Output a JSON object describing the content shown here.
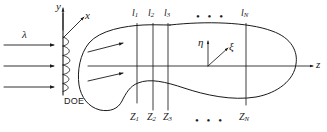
{
  "figure": {
    "stroke_color": "#1a1a1a",
    "background": "#ffffff"
  },
  "source_side": {
    "wavelength_label": "λ",
    "incident_rays_count": 3,
    "element_label": "DOE",
    "axes": {
      "vertical_label": "y",
      "oblique_label": "x"
    }
  },
  "output_side": {
    "axes": {
      "optical_axis_label": "z",
      "transverse_vertical_label": "η",
      "transverse_oblique_label": "ξ"
    },
    "diverging_rays_count": 3,
    "plane_labels": [
      {
        "name": "l1",
        "text": "l",
        "subscript": "1"
      },
      {
        "name": "l2",
        "text": "l",
        "subscript": "2"
      },
      {
        "name": "l3",
        "text": "l",
        "subscript": "3"
      },
      {
        "name": "lN",
        "text": "l",
        "subscript": "N"
      }
    ],
    "plane_ellipsis": "• • •",
    "distance_labels": [
      {
        "name": "z1",
        "text": "Z",
        "subscript": "1"
      },
      {
        "name": "z2",
        "text": "Z",
        "subscript": "2"
      },
      {
        "name": "z3",
        "text": "Z",
        "subscript": "3"
      },
      {
        "name": "zN",
        "text": "Z",
        "subscript": "N"
      }
    ],
    "distance_ellipsis": "• • •"
  }
}
